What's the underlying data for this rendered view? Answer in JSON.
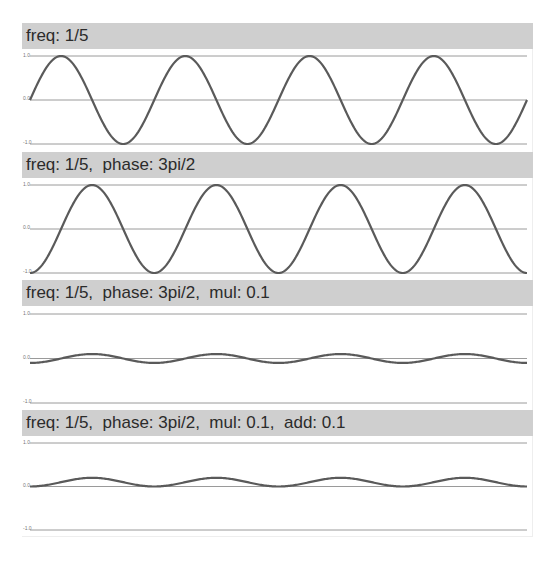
{
  "colors": {
    "header_bg": "#cfcfcf",
    "header_text": "#2b2b2b",
    "grid_line": "#9a9a9a",
    "curve": "#5a5a5a",
    "frame_border": "#eeeeee"
  },
  "y_ticks": [
    "1.0",
    "0.0",
    "-1.0"
  ],
  "panels": [
    {
      "title": "freq: 1/5"
    },
    {
      "title": "freq: 1/5,  phase: 3pi/2"
    },
    {
      "title": "freq: 1/5,  phase: 3pi/2,  mul: 0.1"
    },
    {
      "title": "freq: 1/5,  phase: 3pi/2,  mul: 0.1,  add: 0.1"
    }
  ],
  "chart_data": [
    {
      "type": "line",
      "title": "freq: 1/5",
      "function": "sin",
      "freq": 0.2,
      "phase": 0,
      "mul": 1.0,
      "add": 0.0,
      "cycles": 4,
      "x_range": [
        0,
        20
      ],
      "ylim": [
        -1.0,
        1.0
      ],
      "ytick_labels": [
        "1.0",
        "0.0",
        "-1.0"
      ],
      "grid": true,
      "start_value": 0.0
    },
    {
      "type": "line",
      "title": "freq: 1/5,  phase: 3pi/2",
      "function": "sin",
      "freq": 0.2,
      "phase": 4.71238898,
      "phase_label": "3pi/2",
      "mul": 1.0,
      "add": 0.0,
      "cycles": 4,
      "x_range": [
        0,
        20
      ],
      "ylim": [
        -1.0,
        1.0
      ],
      "ytick_labels": [
        "1.0",
        "0.0",
        "-1.0"
      ],
      "grid": true,
      "start_value": -1.0
    },
    {
      "type": "line",
      "title": "freq: 1/5,  phase: 3pi/2,  mul: 0.1",
      "function": "sin",
      "freq": 0.2,
      "phase": 4.71238898,
      "phase_label": "3pi/2",
      "mul": 0.1,
      "add": 0.0,
      "cycles": 4,
      "x_range": [
        0,
        20
      ],
      "ylim": [
        -1.0,
        1.0
      ],
      "ytick_labels": [
        "1.0",
        "0.0",
        "-1.0"
      ],
      "grid": true,
      "start_value": -0.1
    },
    {
      "type": "line",
      "title": "freq: 1/5,  phase: 3pi/2,  mul: 0.1,  add: 0.1",
      "function": "sin",
      "freq": 0.2,
      "phase": 4.71238898,
      "phase_label": "3pi/2",
      "mul": 0.1,
      "add": 0.1,
      "cycles": 4,
      "x_range": [
        0,
        20
      ],
      "ylim": [
        -1.0,
        1.0
      ],
      "ytick_labels": [
        "1.0",
        "0.0",
        "-1.0"
      ],
      "grid": true,
      "start_value": 0.0
    }
  ]
}
